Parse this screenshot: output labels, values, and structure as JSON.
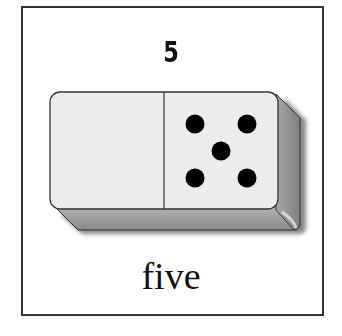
{
  "card": {
    "numeral": "5",
    "word": "five",
    "domino": {
      "left_pips": 0,
      "right_pips": 5,
      "face_color": "#ececec",
      "side_color": "#9a9a9a",
      "pip_color": "#000000"
    }
  }
}
